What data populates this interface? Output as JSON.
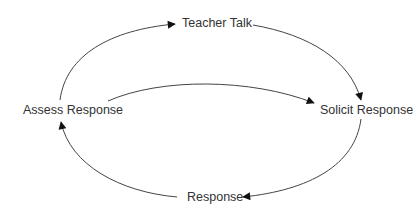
{
  "diagram": {
    "type": "cycle",
    "nodes": [
      {
        "id": "teacher_talk",
        "label": "Teacher Talk"
      },
      {
        "id": "solicit_response",
        "label": "Solicit Response"
      },
      {
        "id": "response",
        "label": "Response"
      },
      {
        "id": "assess_response",
        "label": "Assess Response"
      }
    ],
    "edges": [
      {
        "from": "assess_response",
        "to": "teacher_talk"
      },
      {
        "from": "teacher_talk",
        "to": "solicit_response"
      },
      {
        "from": "solicit_response",
        "to": "response"
      },
      {
        "from": "response",
        "to": "assess_response"
      },
      {
        "from": "assess_response",
        "to": "solicit_response"
      }
    ],
    "colors": {
      "text": "#333333",
      "line": "#444444",
      "arrowhead": "#111111",
      "background": "#ffffff"
    }
  }
}
